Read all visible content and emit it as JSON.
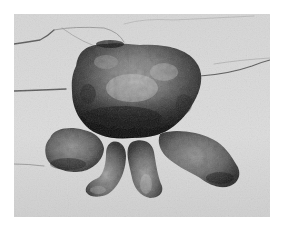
{
  "image": {
    "kind": "grayscale photograph",
    "subject": "lobulated tissue specimen with four finger-like appendages resting on a creased drape",
    "frame": {
      "x": 14,
      "y": 14,
      "width": 256,
      "height": 203
    },
    "colors": {
      "page_background": "#ffffff",
      "drape": "#d9d9d9",
      "drape_crease": "#5a5a5a",
      "mass_light": "#b8b8b8",
      "mass_mid": "#6e6e6e",
      "mass_dark": "#1e1e1e"
    }
  }
}
